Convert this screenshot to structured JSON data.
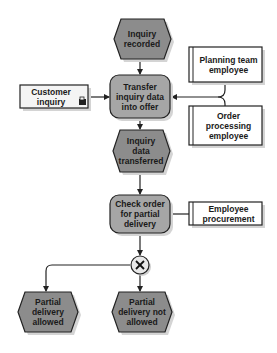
{
  "diagram": {
    "type": "event-driven process chain",
    "colors": {
      "event_fill": "#8c8c8c",
      "function_fill": "#a6a6a6",
      "box_fill": "#f4f4f4",
      "stroke": "#222222",
      "shadow": "#d0d0d0"
    },
    "events": {
      "inquiry_recorded": "Inquiry recorded",
      "inquiry_data_transferred": "Inquiry data transferred",
      "partial_delivery_allowed": "Partial delivery allowed",
      "partial_delivery_not_allowed": "Partial delivery not allowed"
    },
    "functions": {
      "transfer_inquiry": "Transfer inquiry data into offer",
      "check_order": "Check order for partial delivery"
    },
    "information_objects": {
      "customer_inquiry": "Customer inquiry"
    },
    "org_units": {
      "planning_team": "Planning team employee",
      "order_processing": "Order processing employee",
      "employee_procurement": "Employee procurement"
    },
    "connectors": {
      "xor": "×"
    }
  }
}
